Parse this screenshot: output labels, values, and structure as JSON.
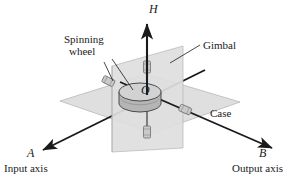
{
  "figure": {
    "background": "#ffffff",
    "ink": "#1a1a1a",
    "plane_fill": "#d9d9d9",
    "plane_stroke": "#9a9a9a",
    "wheel_fill": "#b9b9b9",
    "wheel_top_fill": "#cfcfcf",
    "bearing_fill": "#c4c4c4"
  },
  "labels": {
    "spinning_wheel_line1": "Spinning",
    "spinning_wheel_line2": "wheel",
    "gimbal": "Gimbal",
    "case": "Case",
    "momentum_axis": "H",
    "origin": "O",
    "input_axis_letter": "A",
    "input_axis_name": "Input axis",
    "output_axis_letter": "B",
    "output_axis_name": "Output axis"
  }
}
